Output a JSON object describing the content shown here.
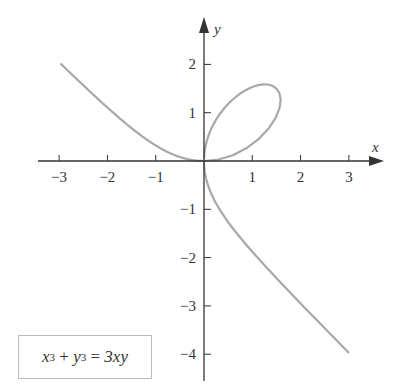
{
  "chart_data": {
    "type": "line",
    "equation": {
      "lhs_x": "x",
      "exp1": "3",
      "plus": "+",
      "lhs_y": "y",
      "exp2": "3",
      "eq": "=",
      "rhs": "3xy"
    },
    "xlabel": "x",
    "ylabel": "y",
    "xlim": [
      -3.3,
      3.6
    ],
    "ylim": [
      -4.3,
      2.4
    ],
    "x_ticks": [
      -3,
      -2,
      -1,
      1,
      2,
      3
    ],
    "y_ticks": [
      2,
      1,
      -1,
      -2,
      -3,
      -4
    ],
    "x_tick_labels": [
      "−3",
      "−2",
      "−1",
      "1",
      "2",
      "3"
    ],
    "y_tick_labels": [
      "2",
      "1",
      "−1",
      "−2",
      "−3",
      "−4"
    ],
    "grid": false,
    "series": [
      {
        "name": "x^3 + y^3 = 3xy",
        "color": "#a8a8a8",
        "param": "x=3t/(1+t^3), y=3t^2/(1+t^3)"
      }
    ],
    "key_points": [
      [
        -3,
        2
      ],
      [
        0,
        0
      ],
      [
        1.5,
        1.5
      ],
      [
        1.26,
        1.59
      ],
      [
        3,
        -4
      ]
    ]
  },
  "colors": {
    "axis": "#333333",
    "curve": "#a8a8a8",
    "box_border": "#bbbbbb"
  }
}
